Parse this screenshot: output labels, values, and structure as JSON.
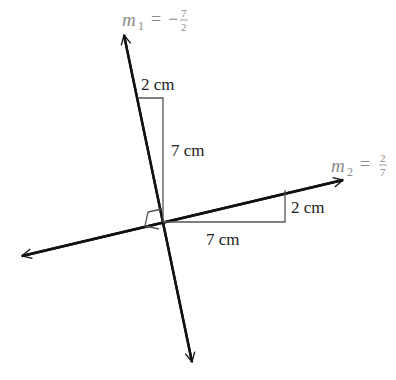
{
  "diagram": {
    "line1": {
      "slope_label_var": "m",
      "slope_label_sub": "1",
      "slope_label_eq": "=",
      "slope_label_sign": "−",
      "slope_num": "7",
      "slope_den": "2",
      "rise_label": "7 cm",
      "run_label": "2 cm"
    },
    "line2": {
      "slope_label_var": "m",
      "slope_label_sub": "2",
      "slope_label_eq": "=",
      "slope_num": "2",
      "slope_den": "7",
      "rise_label": "2 cm",
      "run_label": "7 cm"
    },
    "right_angle_marker": true,
    "colors": {
      "line": "#111111",
      "guide": "#555555",
      "slope_text": "#8a8a8a",
      "label_text": "#222222"
    }
  }
}
